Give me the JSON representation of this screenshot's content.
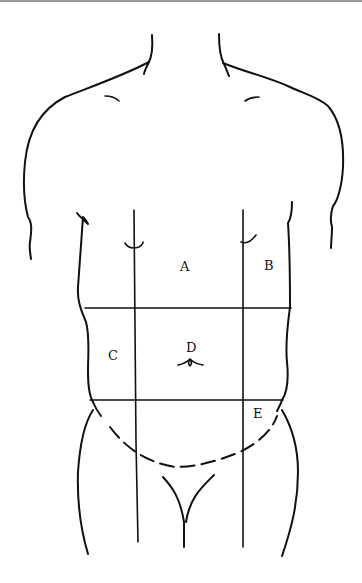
{
  "diagram": {
    "regions": [
      {
        "id": "A",
        "label": "A"
      },
      {
        "id": "B",
        "label": "B"
      },
      {
        "id": "C",
        "label": "C"
      },
      {
        "id": "D",
        "label": "D"
      },
      {
        "id": "E",
        "label": "E"
      }
    ],
    "stroke_color": "#111111",
    "background_color": "#ffffff"
  }
}
